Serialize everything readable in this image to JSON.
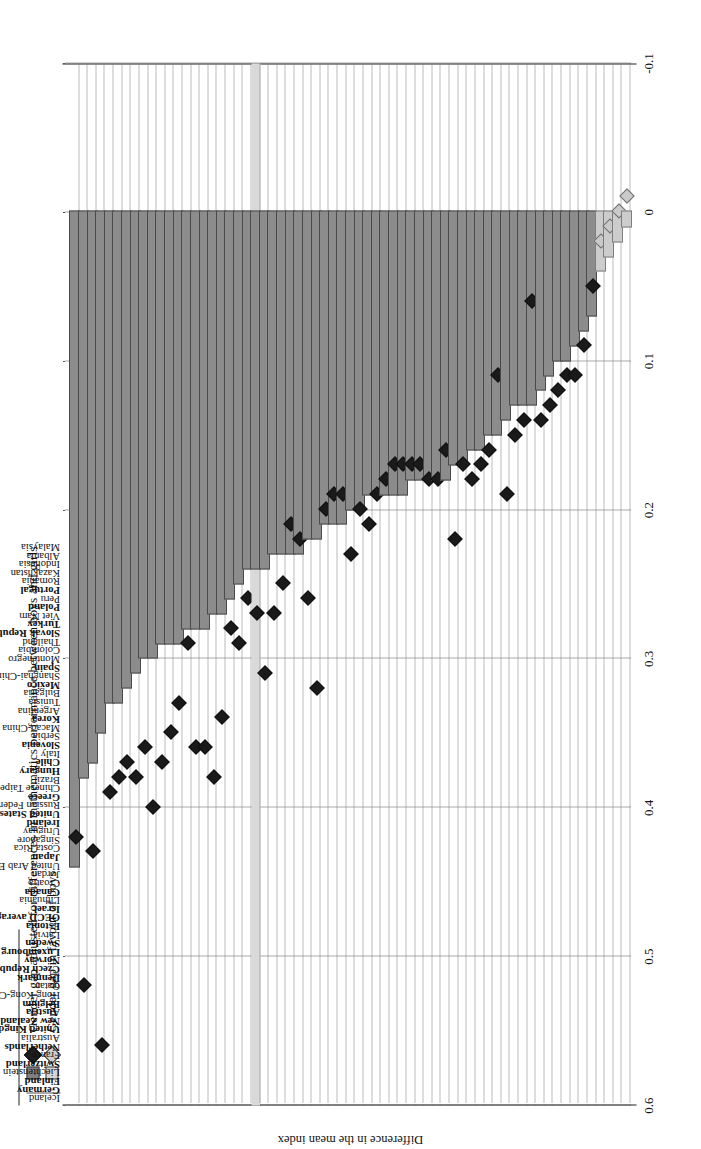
{
  "legend": {
    "rows": [
      {
        "symbols": [
          "dark-square",
          "dark-diamond"
        ],
        "label": "Gender gap adjusted for differences in mathematics performance between boys and girls"
      },
      {
        "symbols": [
          "light-square",
          "light-diamond"
        ],
        "label": "Gender gap in favour of boys"
      }
    ]
  },
  "axis": {
    "value_title": "Difference in the mean index",
    "ticks": [
      "0.6",
      "0.5",
      "0.4",
      "0.3",
      "0.2",
      "0.1",
      "0",
      "-0.1"
    ],
    "tick_values": [
      0.6,
      0.5,
      0.4,
      0.3,
      0.2,
      0.1,
      0,
      -0.1
    ],
    "min": -0.1,
    "max": 0.6
  },
  "colors": {
    "bar_dark": "#8c8c8c",
    "bar_light": "#cccccc",
    "marker_dark": "#1a1a1a",
    "marker_light": "#c9c9c9",
    "highlight_row": "#d9d9d9",
    "grid": "#7a7a7a",
    "axis": "#222222"
  },
  "chart_data": {
    "type": "bar",
    "title": "",
    "xlabel": "",
    "ylabel": "Difference in the mean index",
    "ylim": [
      -0.1,
      0.6
    ],
    "grid": true,
    "legend_position": "top-left",
    "orientation": "horizontal",
    "categories": [
      "Iceland",
      "Germany",
      "Finland",
      "Liechtenstein",
      "Switzerland",
      "France",
      "Netherlands",
      "Australia",
      "United Kingdom",
      "New Zealand",
      "Austria",
      "Belgium",
      "Hong Kong-China",
      "Qatar",
      "Denmark",
      "Czech Republic",
      "Norway",
      "Luxembourg",
      "Sweden",
      "Latvia",
      "Estonia",
      "OECD average",
      "Israel",
      "Lithuania",
      "Canada",
      "Croatia",
      "Jordan",
      "United Arab Emirates",
      "Japan",
      "Costa Rica",
      "Singapore",
      "Uruguay",
      "Ireland",
      "United States",
      "Russian Federation",
      "Greece",
      "Chinese Taipei",
      "Brazil",
      "Hungary",
      "Chile",
      "Italy",
      "Slovenia",
      "Serbia",
      "Macao-China",
      "Korea",
      "Argentina",
      "Tunisia",
      "Bulgaria",
      "Mexico",
      "Shanghai-China",
      "Spain",
      "Montenegro",
      "Colombia",
      "Thailand",
      "Slovak Republic",
      "Turkey",
      "Viet Nam",
      "Poland",
      "Peru",
      "Portugal",
      "Romania",
      "Kazakhstan",
      "Indonesia",
      "Albania",
      "Malaysia"
    ],
    "bold_categories": [
      "Germany",
      "Finland",
      "Switzerland",
      "Netherlands",
      "United Kingdom",
      "New Zealand",
      "Austria",
      "Belgium",
      "Denmark",
      "Czech Republic",
      "Norway",
      "Luxembourg",
      "Sweden",
      "Estonia",
      "OECD average",
      "Israel",
      "Canada",
      "Japan",
      "Ireland",
      "United States",
      "Greece",
      "Hungary",
      "Chile",
      "Slovenia",
      "Korea",
      "Mexico",
      "Spain",
      "Slovak Republic",
      "Turkey",
      "Poland",
      "Portugal"
    ],
    "highlight_category": "OECD average",
    "series": [
      {
        "name": "Gender gap in favour of boys",
        "symbol": "bar",
        "values": [
          0.44,
          0.38,
          0.37,
          0.35,
          0.33,
          0.33,
          0.32,
          0.31,
          0.3,
          0.3,
          0.29,
          0.29,
          0.29,
          0.28,
          0.28,
          0.28,
          0.27,
          0.27,
          0.26,
          0.25,
          0.24,
          0.24,
          0.24,
          0.23,
          0.23,
          0.23,
          0.23,
          0.22,
          0.22,
          0.21,
          0.21,
          0.21,
          0.2,
          0.2,
          0.19,
          0.19,
          0.19,
          0.19,
          0.19,
          0.18,
          0.18,
          0.18,
          0.18,
          0.18,
          0.17,
          0.17,
          0.16,
          0.16,
          0.15,
          0.15,
          0.14,
          0.13,
          0.13,
          0.13,
          0.12,
          0.11,
          0.1,
          0.1,
          0.09,
          0.08,
          0.07,
          0.04,
          0.03,
          0.02,
          0.01
        ],
        "light_from_category": "Kazakhstan"
      },
      {
        "name": "Gender gap adjusted for differences in mathematics performance between boys and girls",
        "symbol": "diamond",
        "values": [
          0.42,
          0.52,
          0.43,
          0.56,
          0.39,
          0.38,
          0.37,
          0.38,
          0.36,
          0.4,
          0.37,
          0.35,
          0.33,
          0.29,
          0.36,
          0.36,
          0.38,
          0.34,
          0.28,
          0.29,
          0.26,
          0.27,
          0.31,
          0.27,
          0.25,
          0.21,
          0.22,
          0.26,
          0.32,
          0.2,
          0.19,
          0.19,
          0.23,
          0.2,
          0.21,
          0.19,
          0.18,
          0.17,
          0.17,
          0.17,
          0.17,
          0.18,
          0.18,
          0.16,
          0.22,
          0.17,
          0.18,
          0.17,
          0.16,
          0.11,
          0.19,
          0.15,
          0.14,
          0.06,
          0.14,
          0.13,
          0.12,
          0.11,
          0.11,
          0.09,
          0.05,
          0.02,
          0.01,
          0.0,
          -0.01
        ],
        "light_from_category": "Kazakhstan"
      }
    ]
  }
}
